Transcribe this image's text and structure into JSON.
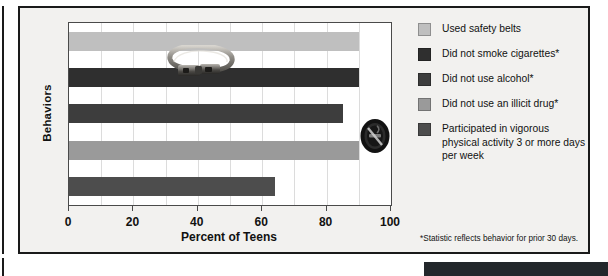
{
  "chart_data": {
    "type": "bar",
    "orientation": "horizontal",
    "title": "",
    "xlabel": "Percent of Teens",
    "ylabel": "Behaviors",
    "xlim": [
      0,
      100
    ],
    "xticks": [
      0,
      20,
      40,
      60,
      80,
      100
    ],
    "gridlines": [
      10,
      20,
      30,
      40,
      50,
      60,
      70,
      80,
      90
    ],
    "grid": true,
    "legend_position": "right",
    "categories": [
      "Used safety belts",
      "Did not smoke cigarettes*",
      "Did not use alcohol*",
      "Did not use an illicit drug*",
      "Participated in vigorous physical activity 3 or more days per week"
    ],
    "values": [
      90,
      90,
      85,
      90,
      64
    ],
    "colors": [
      "#bfbfbf",
      "#2f2f2f",
      "#3d3d3d",
      "#9a9a9a",
      "#4d4d4d"
    ],
    "annotations": [
      "*Statistic reflects behavior for prior 30 days."
    ]
  },
  "axes": {
    "y_title": "Behaviors",
    "x_title": "Percent of Teens",
    "x_tick_labels": [
      "0",
      "20",
      "40",
      "60",
      "80",
      "100"
    ]
  },
  "legend": {
    "items": [
      {
        "label": "Used safety belts",
        "color": "#bfbfbf"
      },
      {
        "label": "Did not smoke cigarettes*",
        "color": "#2f2f2f"
      },
      {
        "label": "Did not use alcohol*",
        "color": "#3d3d3d"
      },
      {
        "label": "Did not use an illicit drug*",
        "color": "#9a9a9a"
      },
      {
        "label": "Participated in vigorous physical activity 3 or more days per week",
        "color": "#4d4d4d"
      }
    ]
  },
  "footnote": "*Statistic reflects behavior for prior 30 days.",
  "overlays": [
    {
      "name": "seatbelt-photo",
      "on_bar": 0
    },
    {
      "name": "no-smoking-symbol",
      "on_bar": 2
    }
  ]
}
